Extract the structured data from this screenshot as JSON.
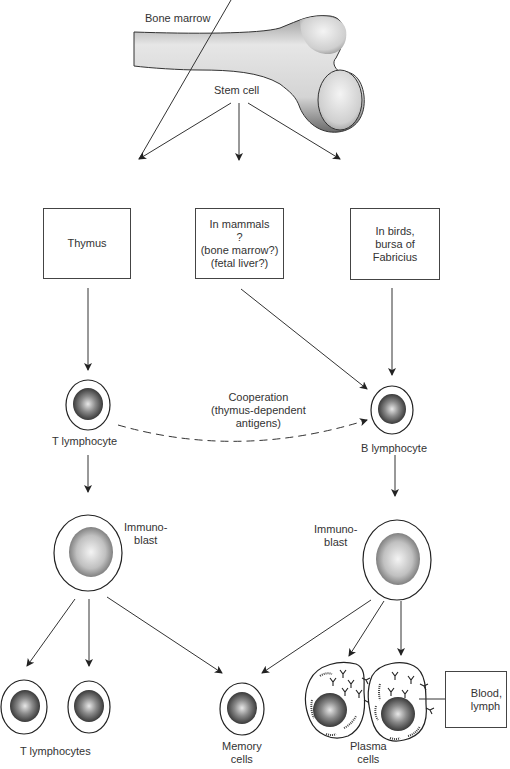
{
  "diagram": {
    "top": {
      "bone_label": "Bone marrow",
      "stem_label": "Stem cell"
    },
    "organs": [
      {
        "label": "Thymus"
      },
      {
        "label": "In mammals\n?\n(bone marrow?)\n(fetal liver?)"
      },
      {
        "label": "In birds,\nbursa of\nFabricius"
      }
    ],
    "lymphocytes": {
      "t_label": "T lymphocyte",
      "b_label": "B lymphocyte",
      "cooperation_label": "Cooperation\n(thymus-dependent\nantigens)"
    },
    "immunoblasts": {
      "t_label": "Immuno-\nblast",
      "b_label": "Immuno-\nblast"
    },
    "products": {
      "t_lymphocytes_label": "T lymphocytes",
      "memory_label": "Memory\ncells",
      "plasma_label": "Plasma\ncells",
      "blood_label": "Blood,\nlymph"
    },
    "colors": {
      "line": "#333333",
      "text": "#333333",
      "nucleus": "#555555"
    }
  }
}
